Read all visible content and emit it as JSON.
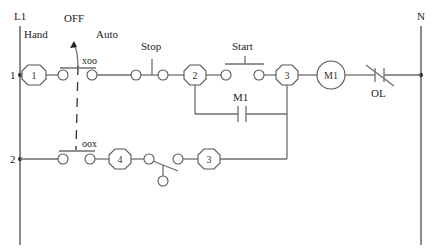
{
  "diagram": {
    "rails": {
      "left_label": "L1",
      "right_label": "N"
    },
    "rungs": [
      {
        "number": "1"
      },
      {
        "number": "2"
      }
    ],
    "selector_switch": {
      "positions": [
        "Hand",
        "OFF",
        "Auto"
      ],
      "rung1_contact_label": "xoo",
      "rung2_contact_label": "oox"
    },
    "wire_numbers": {
      "n1": "1",
      "n2": "2",
      "n3_top": "3",
      "n4": "4",
      "n3_bottom": "3"
    },
    "stop_button": {
      "label": "Stop"
    },
    "start_button": {
      "label": "Start"
    },
    "seal_in_contact": {
      "label": "M1"
    },
    "motor_coil": {
      "label": "M1"
    },
    "overload": {
      "label": "OL"
    }
  }
}
